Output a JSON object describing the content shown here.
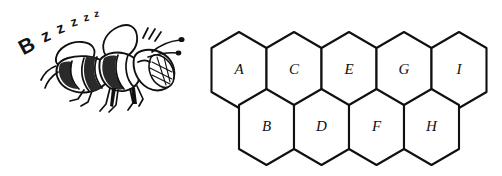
{
  "figure": {
    "background_color": "#ffffff",
    "ink_color": "#101010",
    "width": 502,
    "height": 176
  },
  "buzz": {
    "text": "Bzzzzz",
    "letters": [
      {
        "char": "B",
        "x": 30,
        "y": 52,
        "size": 21,
        "rotate": -28
      },
      {
        "char": "z",
        "x": 48,
        "y": 41,
        "size": 17,
        "rotate": -24
      },
      {
        "char": "z",
        "x": 62,
        "y": 33,
        "size": 15,
        "rotate": -20
      },
      {
        "char": "z",
        "x": 75,
        "y": 26,
        "size": 13,
        "rotate": -16
      },
      {
        "char": "z",
        "x": 87,
        "y": 21,
        "size": 11,
        "rotate": -12
      },
      {
        "char": "z",
        "x": 97,
        "y": 17,
        "size": 10,
        "rotate": -8
      }
    ]
  },
  "bee": {
    "name": "bee-illustration",
    "description": "line-art honeybee flying to the right with motion lines",
    "parts": [
      "wing-upper",
      "wing-lower",
      "thorax",
      "abdomen-stripes",
      "head",
      "eye",
      "antenna-left",
      "antenna-right",
      "legs",
      "motion-lines"
    ]
  },
  "honeycomb": {
    "name": "honeycomb-grid",
    "rows": 2,
    "cell_count": 9,
    "top_row_labels": [
      "A",
      "C",
      "E",
      "G",
      "I"
    ],
    "bottom_row_labels": [
      "B",
      "D",
      "F",
      "H"
    ],
    "cells": [
      {
        "label": "A",
        "row": "top",
        "cx": 239,
        "cy": 70
      },
      {
        "label": "C",
        "row": "top",
        "cx": 294,
        "cy": 70
      },
      {
        "label": "E",
        "row": "top",
        "cx": 349,
        "cy": 70
      },
      {
        "label": "G",
        "row": "top",
        "cx": 404,
        "cy": 70
      },
      {
        "label": "I",
        "row": "top",
        "cx": 459,
        "cy": 70
      },
      {
        "label": "B",
        "row": "bottom",
        "cx": 267,
        "cy": 127
      },
      {
        "label": "D",
        "row": "bottom",
        "cx": 322,
        "cy": 127
      },
      {
        "label": "F",
        "row": "bottom",
        "cx": 376,
        "cy": 127
      },
      {
        "label": "H",
        "row": "bottom",
        "cx": 431,
        "cy": 127
      }
    ],
    "geometry": {
      "half_width": 27.5,
      "side_half_height": 22,
      "point_height": 16
    }
  }
}
